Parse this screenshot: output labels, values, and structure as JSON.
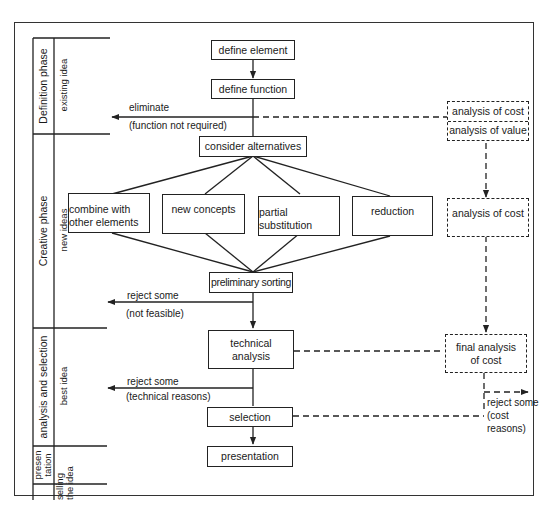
{
  "phases": [
    {
      "name": "Definition phase",
      "sub": "existing idea"
    },
    {
      "name": "Creative phase",
      "sub": "new ideas"
    },
    {
      "name": "analysis and selection",
      "sub": "best idea"
    },
    {
      "name_line1": "presen",
      "name_line2": "tation",
      "sub_line1": "selling",
      "sub_line2": "the idea"
    }
  ],
  "flow": {
    "define_element": "define element",
    "define_function": "define function",
    "consider_alternatives": "consider alternatives",
    "alternatives": [
      {
        "line1": "combine with",
        "line2": "other elements"
      },
      {
        "line1": "new concepts",
        "line2": ""
      },
      {
        "line1": "partial",
        "line2": "substitution"
      },
      {
        "line1": "reduction",
        "line2": ""
      }
    ],
    "preliminary_sorting": "preliminary sorting",
    "technical_analysis_line1": "technical",
    "technical_analysis_line2": "analysis",
    "selection": "selection",
    "presentation": "presentation"
  },
  "rejections": {
    "eliminate": "eliminate",
    "eliminate_reason": "(function not required)",
    "reject_feasible": "reject some",
    "reject_feasible_reason": "(not feasible)",
    "reject_technical": "reject some",
    "reject_technical_reason": "(technical reasons)",
    "reject_cost_line1": "reject some",
    "reject_cost_line2": "(cost",
    "reject_cost_line3": "reasons)"
  },
  "cost_track": {
    "analysis_of_cost": "analysis of cost",
    "analysis_of_value": "analysis of value",
    "analysis_of_cost_2": "analysis of cost",
    "final_line1": "final analysis",
    "final_line2": "of cost"
  }
}
